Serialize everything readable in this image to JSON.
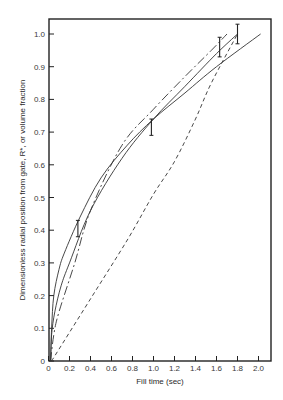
{
  "chart_data": {
    "type": "line",
    "title": "",
    "xlabel": "Fill time (sec)",
    "ylabel": "Dimensionless radial position from gate, R*, or volume fraction",
    "xlim": [
      0,
      2.1
    ],
    "ylim": [
      0,
      1.05
    ],
    "xticks": [
      0,
      0.2,
      0.4,
      0.6,
      0.8,
      1.0,
      1.2,
      1.4,
      1.6,
      1.8,
      2.0
    ],
    "xtick_labels": [
      "0",
      "0.2",
      "0.4",
      "0.6",
      "0.8",
      "1.0",
      "1.2",
      "1.4",
      "1.6",
      "1.8",
      "2.0"
    ],
    "yticks": [
      0,
      0.1,
      0.2,
      0.3,
      0.4,
      0.5,
      0.6,
      0.7,
      0.8,
      0.9,
      1.0
    ],
    "ytick_labels": [
      "0",
      "0.1",
      "0.2",
      "0.3",
      "0.4",
      "0.5",
      "0.6",
      "0.7",
      "0.8",
      "0.9",
      "1.0"
    ],
    "grid": false,
    "legend": null,
    "series": [
      {
        "name": "solid curve A",
        "style": "solid",
        "x": [
          0.02,
          0.03,
          0.05,
          0.1,
          0.15,
          0.3,
          0.5,
          0.75,
          1.0,
          1.3,
          1.6,
          2.02
        ],
        "y": [
          0,
          0.1,
          0.2,
          0.28,
          0.33,
          0.44,
          0.56,
          0.66,
          0.74,
          0.82,
          0.9,
          1.0
        ]
      },
      {
        "name": "solid curve B",
        "style": "solid",
        "x": [
          0.02,
          0.03,
          0.06,
          0.12,
          0.2,
          0.4,
          0.7,
          1.0,
          1.3,
          1.6,
          1.8
        ],
        "y": [
          0,
          0.08,
          0.15,
          0.23,
          0.3,
          0.46,
          0.62,
          0.74,
          0.84,
          0.94,
          1.0
        ]
      },
      {
        "name": "dash-dot curve C",
        "style": "dashdot",
        "x": [
          0.02,
          0.05,
          0.1,
          0.25,
          0.4,
          0.7,
          1.0,
          1.3,
          1.55,
          1.7
        ],
        "y": [
          0,
          0.08,
          0.15,
          0.3,
          0.46,
          0.66,
          0.77,
          0.87,
          0.95,
          1.0
        ]
      },
      {
        "name": "dashed curve D (volume fraction)",
        "style": "dashed",
        "x": [
          0.03,
          0.4,
          0.75,
          1.0,
          1.2,
          1.4,
          1.55,
          1.8
        ],
        "y": [
          0,
          0.19,
          0.37,
          0.51,
          0.61,
          0.74,
          0.85,
          1.0
        ]
      }
    ],
    "error_bars": [
      {
        "x": 0.28,
        "y": 0.405,
        "ymin": 0.38,
        "ymax": 0.43
      },
      {
        "x": 0.98,
        "y": 0.715,
        "ymin": 0.69,
        "ymax": 0.74
      },
      {
        "x": 1.63,
        "y": 0.96,
        "ymin": 0.93,
        "ymax": 0.99
      },
      {
        "x": 1.8,
        "y": 1.0,
        "ymin": 0.97,
        "ymax": 1.03
      }
    ]
  }
}
